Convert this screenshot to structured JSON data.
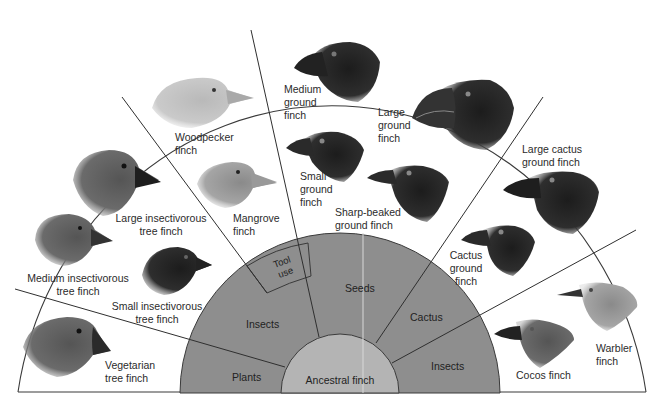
{
  "diagram": {
    "center": {
      "label": "Ancestral finch"
    },
    "diet_ring": [
      {
        "id": "plants",
        "label": "Plants"
      },
      {
        "id": "insects-left",
        "label": "Insects"
      },
      {
        "id": "tool-use",
        "label_line1": "Tool",
        "label_line2": "use"
      },
      {
        "id": "seeds",
        "label": "Seeds"
      },
      {
        "id": "cactus",
        "label": "Cactus"
      },
      {
        "id": "insects-right",
        "label": "Insects"
      }
    ],
    "species": [
      {
        "id": "vegetarian-tree-finch",
        "lines": [
          "Vegetarian",
          "tree finch"
        ],
        "diet": "Plants"
      },
      {
        "id": "medium-insectivorous-tree-finch",
        "lines": [
          "Medium insectivorous",
          "tree finch"
        ],
        "diet": "Insects"
      },
      {
        "id": "small-insectivorous-tree-finch",
        "lines": [
          "Small insectivorous",
          "tree finch"
        ],
        "diet": "Insects"
      },
      {
        "id": "large-insectivorous-tree-finch",
        "lines": [
          "Large insectivorous",
          "tree finch"
        ],
        "diet": "Insects"
      },
      {
        "id": "woodpecker-finch",
        "lines": [
          "Woodpecker",
          "finch"
        ],
        "diet": "Tool use"
      },
      {
        "id": "mangrove-finch",
        "lines": [
          "Mangrove",
          "finch"
        ],
        "diet": "Tool use"
      },
      {
        "id": "medium-ground-finch",
        "lines": [
          "Medium",
          "ground",
          "finch"
        ],
        "diet": "Seeds"
      },
      {
        "id": "small-ground-finch",
        "lines": [
          "Small",
          "ground",
          "finch"
        ],
        "diet": "Seeds"
      },
      {
        "id": "large-ground-finch",
        "lines": [
          "Large",
          "ground",
          "finch"
        ],
        "diet": "Seeds"
      },
      {
        "id": "sharp-beaked-ground-finch",
        "lines": [
          "Sharp-beaked",
          "ground finch"
        ],
        "diet": "Seeds"
      },
      {
        "id": "large-cactus-ground-finch",
        "lines": [
          "Large cactus",
          "ground finch"
        ],
        "diet": "Cactus"
      },
      {
        "id": "cactus-ground-finch",
        "lines": [
          "Cactus",
          "ground",
          "finch"
        ],
        "diet": "Cactus"
      },
      {
        "id": "cocos-finch",
        "lines": [
          "Cocos finch"
        ],
        "diet": "Insects"
      },
      {
        "id": "warbler-finch",
        "lines": [
          "Warbler",
          "finch"
        ],
        "diet": "Insects"
      }
    ],
    "colors": {
      "background": "#ffffff",
      "outline": "#3a3a3a",
      "diet_ring": "#8e8e8e",
      "center": "#b4b4b4"
    }
  }
}
